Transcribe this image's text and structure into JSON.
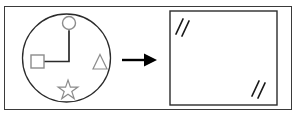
{
  "figure": {
    "type": "transformation-diagram",
    "frame": {
      "name": "outer-frame",
      "stroke_color": "#3a3a3a",
      "fill_color": "#ffffff",
      "x": 4,
      "y": 6,
      "width": 288,
      "height": 104
    },
    "left_panel": {
      "name": "source-scene",
      "container": {
        "shape": "circle",
        "cx": 66.5,
        "cy": 58,
        "r": 44,
        "stroke_color": "#2b2b2b",
        "fill_color": "#ffffff"
      },
      "shapes": [
        {
          "name": "circle-node",
          "shape": "circle",
          "cx": 69,
          "cy": 23,
          "r": 6.5,
          "stroke_color": "#8c8c8c",
          "fill_color": "#ffffff"
        },
        {
          "name": "square-node",
          "shape": "square",
          "x": 31,
          "y": 55,
          "size": 13,
          "stroke_color": "#8c8c8c",
          "fill_color": "#ffffff"
        },
        {
          "name": "triangle-node",
          "shape": "triangle",
          "cx": 100,
          "cy": 62,
          "size": 14,
          "stroke_color": "#8c8c8c",
          "fill_color": "#ffffff"
        },
        {
          "name": "star-node",
          "shape": "star",
          "cx": 68,
          "cy": 90,
          "r": 10,
          "points": 5,
          "stroke_color": "#8c8c8c",
          "fill_color": "#ffffff"
        }
      ],
      "connector": {
        "name": "elbow-connector",
        "shape": "polyline",
        "points": "69,31 69,61.5 44,61.5",
        "stroke_color": "#2b2b2b",
        "stroke_width": 1.6
      }
    },
    "arrow": {
      "name": "transform-arrow",
      "direction": "right",
      "x1": 122,
      "y1": 60,
      "x2": 145,
      "y2": 60,
      "head_width": 12,
      "head_height": 13,
      "color": "#000000"
    },
    "right_panel": {
      "name": "result-scene",
      "container": {
        "shape": "rectangle",
        "x": 170,
        "y": 11,
        "width": 107,
        "height": 94,
        "stroke_color": "#2b2b2b",
        "fill_color": "#ffffff"
      },
      "marks": [
        {
          "name": "slash-mark-top-left-a",
          "x1": 176,
          "y1": 34,
          "x2": 183,
          "y2": 19,
          "stroke_color": "#1a1a1a",
          "stroke_width": 1.6
        },
        {
          "name": "slash-mark-top-left-b",
          "x1": 182,
          "y1": 36,
          "x2": 189,
          "y2": 21,
          "stroke_color": "#1a1a1a",
          "stroke_width": 1.6
        },
        {
          "name": "slash-mark-bottom-right-a",
          "x1": 252,
          "y1": 96,
          "x2": 259,
          "y2": 81,
          "stroke_color": "#1a1a1a",
          "stroke_width": 1.6
        },
        {
          "name": "slash-mark-bottom-right-b",
          "x1": 258,
          "y1": 98,
          "x2": 265,
          "y2": 83,
          "stroke_color": "#1a1a1a",
          "stroke_width": 1.6
        }
      ]
    }
  }
}
